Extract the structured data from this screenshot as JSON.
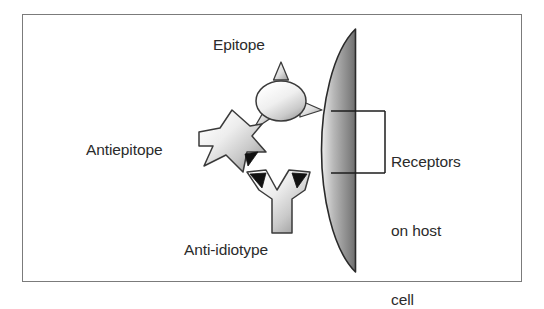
{
  "figure": {
    "type": "biology-diagram",
    "topic": "Anti-idiotype antibody network at a host cell receptor",
    "border_color": "#7b7b7b",
    "background_color": "#ffffff",
    "text_color": "#2b2b2b"
  },
  "labels": {
    "epitope": "Epitope",
    "antiepitope": "Antiepitope",
    "anti_idiotype": "Anti-idiotype",
    "receptors_line1": "Receptors",
    "receptors_line2": "on host",
    "receptors_line3": "cell"
  },
  "elements": {
    "epitope_shape": "spiked-oval-antigen",
    "antiepitope_shape": "y-shaped-antibody-rotated",
    "anti_idiotype_shape": "y-shaped-antibody-upright",
    "membrane_shape": "curved-cell-membrane",
    "bracket_shape": "leader-bracket"
  },
  "colors": {
    "membrane_light": "#e8e8e8",
    "membrane_dark": "#6f6f6f",
    "membrane_outline": "#2a2a2a",
    "protein_light": "#fdfdfd",
    "protein_mid": "#d5d5d5",
    "protein_dark": "#9a9a9a",
    "protein_outline": "#3a3a3a",
    "notch_fill": "#111111",
    "bracket_stroke": "#1c1c1c"
  }
}
